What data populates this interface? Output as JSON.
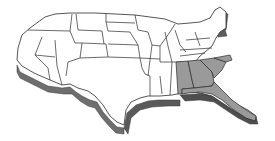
{
  "map": {
    "type": "us-states-3d",
    "colors": {
      "background": "#ffffff",
      "state_fill": "#ffffff",
      "state_stroke": "#2b2b2b",
      "highlight_fill": "#9a9a9a",
      "extrusion": "#6e6e6e",
      "extrusion_dark": "#4a4a4a"
    },
    "highlighted_states": [
      "Alabama",
      "Georgia",
      "South Carolina",
      "Florida"
    ]
  }
}
